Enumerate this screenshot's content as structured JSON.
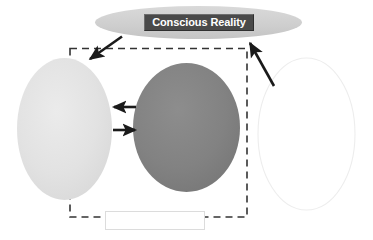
{
  "diagram": {
    "title_node": {
      "label": "Conscious Reality",
      "shape": "ellipse",
      "fill_color": "#cfcfcf",
      "label_box_color": "#4a4a4a",
      "label_text_color": "#ffffff"
    },
    "nodes": [
      {
        "id": "left-ellipse",
        "label": "",
        "shape": "ellipse",
        "fill_color": "#e2e2e2"
      },
      {
        "id": "middle-ellipse",
        "label": "",
        "shape": "ellipse",
        "fill_color": "#808080"
      },
      {
        "id": "right-ellipse",
        "label": "",
        "shape": "ellipse",
        "fill_color": "#ffffff",
        "stroke_color": "#eeeeee"
      },
      {
        "id": "bottom-box",
        "label": "",
        "shape": "rectangle",
        "fill_color": "#ffffff",
        "stroke_color": "#dddddd"
      }
    ],
    "grouping_box": {
      "style": "dashed",
      "stroke_color": "#333333"
    },
    "arrows": [
      {
        "id": "arrow-title-to-group",
        "direction": "down-left",
        "color": "#1a1a1a"
      },
      {
        "id": "arrow-right-to-title",
        "direction": "up-left",
        "color": "#1a1a1a"
      },
      {
        "id": "arrow-middle-to-left",
        "direction": "left",
        "color": "#1a1a1a"
      },
      {
        "id": "arrow-left-to-middle",
        "direction": "right",
        "color": "#1a1a1a"
      }
    ]
  }
}
